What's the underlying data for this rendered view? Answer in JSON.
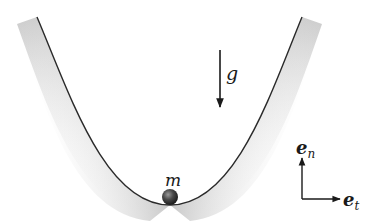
{
  "diagram": {
    "type": "particle-in-parabolic-bowl",
    "mass_label": "m",
    "gravity_label": "g",
    "basis": {
      "normal": {
        "base": "e",
        "subscript": "n"
      },
      "tangent": {
        "base": "e",
        "subscript": "t"
      }
    },
    "colors": {
      "curve": "#2a2a2a",
      "shade": "#9a9a9a",
      "ball": "#3a3a3a",
      "arrow": "#1a1a1a",
      "background": "#ffffff"
    }
  }
}
